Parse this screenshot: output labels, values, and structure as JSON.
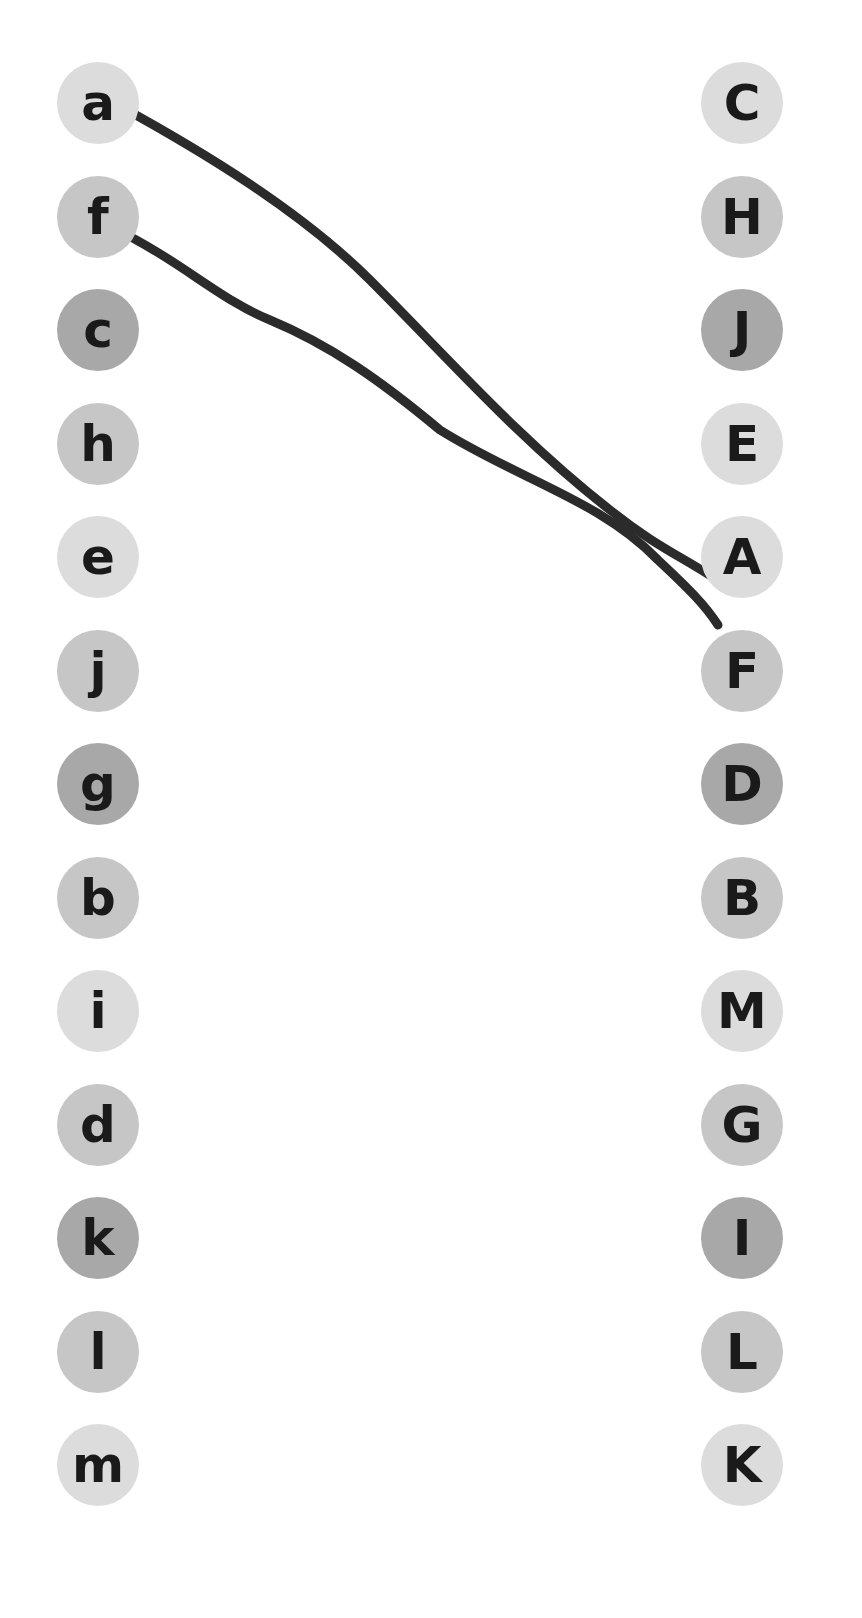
{
  "puzzle": {
    "type": "match lowercase to uppercase letters",
    "left_column": [
      {
        "letter": "a",
        "shade": "light"
      },
      {
        "letter": "f",
        "shade": "medium"
      },
      {
        "letter": "c",
        "shade": "dark"
      },
      {
        "letter": "h",
        "shade": "medium"
      },
      {
        "letter": "e",
        "shade": "light"
      },
      {
        "letter": "j",
        "shade": "medium"
      },
      {
        "letter": "g",
        "shade": "dark"
      },
      {
        "letter": "b",
        "shade": "medium"
      },
      {
        "letter": "i",
        "shade": "light"
      },
      {
        "letter": "d",
        "shade": "medium"
      },
      {
        "letter": "k",
        "shade": "dark"
      },
      {
        "letter": "l",
        "shade": "medium"
      },
      {
        "letter": "m",
        "shade": "light"
      }
    ],
    "right_column": [
      {
        "letter": "C",
        "shade": "light"
      },
      {
        "letter": "H",
        "shade": "medium"
      },
      {
        "letter": "J",
        "shade": "dark"
      },
      {
        "letter": "E",
        "shade": "light"
      },
      {
        "letter": "A",
        "shade": "light"
      },
      {
        "letter": "F",
        "shade": "medium"
      },
      {
        "letter": "D",
        "shade": "dark"
      },
      {
        "letter": "B",
        "shade": "medium"
      },
      {
        "letter": "M",
        "shade": "light"
      },
      {
        "letter": "G",
        "shade": "medium"
      },
      {
        "letter": "I",
        "shade": "dark"
      },
      {
        "letter": "L",
        "shade": "medium"
      },
      {
        "letter": "K",
        "shade": "light"
      }
    ],
    "connections": [
      {
        "from": "a",
        "to": "A"
      },
      {
        "from": "f",
        "to": "F"
      }
    ]
  },
  "colors": {
    "light": "#dcdcdc",
    "medium": "#c6c6c6",
    "dark": "#a8a8a8",
    "stroke": "#2b2b2b",
    "text": "#1a1a1a"
  }
}
